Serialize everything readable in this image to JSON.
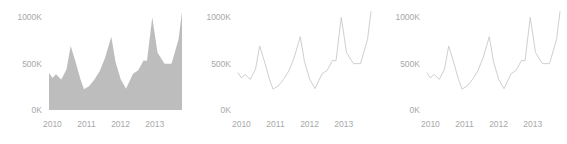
{
  "chart_data": [
    {
      "type": "area",
      "title": "",
      "xlabel": "",
      "ylabel": "",
      "grid": false,
      "legend": "none",
      "fill_color": "#bdbdbd",
      "line_color": "#bdbdbd",
      "ylim": [
        0,
        1100000
      ],
      "xlim": [
        2009.9,
        2013.8
      ],
      "ytick_values": [
        0,
        500000,
        1000000
      ],
      "ytick_labels": [
        "0K",
        "500K",
        "1000K"
      ],
      "xtick_values": [
        2010,
        2011,
        2012,
        2013
      ],
      "xtick_labels": [
        "2010",
        "2011",
        "2012",
        "2013"
      ],
      "x": [
        2010.0,
        2010.1,
        2010.2,
        2010.35,
        2010.5,
        2010.62,
        2010.75,
        2010.9,
        2011.0,
        2011.15,
        2011.3,
        2011.45,
        2011.6,
        2011.78,
        2011.9,
        2012.05,
        2012.2,
        2012.4,
        2012.55,
        2012.7,
        2012.8,
        2012.95,
        2013.1,
        2013.3,
        2013.5,
        2013.7
      ],
      "values": [
        400000,
        345000,
        385000,
        330000,
        440000,
        690000,
        530000,
        330000,
        225000,
        260000,
        330000,
        420000,
        560000,
        790000,
        520000,
        330000,
        230000,
        390000,
        430000,
        535000,
        530000,
        1000000,
        620000,
        500000,
        500000,
        760000,
        1060000
      ]
    },
    {
      "type": "line",
      "title": "",
      "xlabel": "",
      "ylabel": "",
      "grid": false,
      "legend": "none",
      "line_color": "#cfcfcf",
      "ylim": [
        0,
        1100000
      ],
      "xlim": [
        2009.9,
        2013.8
      ],
      "ytick_values": [
        0,
        500000,
        1000000
      ],
      "ytick_labels": [
        "0K",
        "500K",
        "1000K"
      ],
      "xtick_values": [
        2010,
        2011,
        2012,
        2013
      ],
      "xtick_labels": [
        "2010",
        "2011",
        "2012",
        "2013"
      ],
      "x": [
        2010.0,
        2010.1,
        2010.2,
        2010.35,
        2010.5,
        2010.62,
        2010.75,
        2010.9,
        2011.0,
        2011.15,
        2011.3,
        2011.45,
        2011.6,
        2011.78,
        2011.9,
        2012.05,
        2012.2,
        2012.4,
        2012.55,
        2012.7,
        2012.8,
        2012.95,
        2013.1,
        2013.3,
        2013.5,
        2013.7
      ],
      "values": [
        400000,
        345000,
        385000,
        330000,
        440000,
        690000,
        530000,
        330000,
        225000,
        260000,
        330000,
        420000,
        560000,
        790000,
        520000,
        330000,
        230000,
        390000,
        430000,
        535000,
        530000,
        1000000,
        620000,
        500000,
        500000,
        760000,
        1060000
      ]
    },
    {
      "type": "line",
      "title": "",
      "xlabel": "",
      "ylabel": "",
      "grid": false,
      "legend": "none",
      "line_color": "#cfcfcf",
      "ylim": [
        0,
        1100000
      ],
      "xlim": [
        2009.9,
        2013.8
      ],
      "ytick_values": [
        0,
        500000,
        1000000
      ],
      "ytick_labels": [
        "0K",
        "500K",
        "1000K"
      ],
      "xtick_values": [
        2010,
        2011,
        2012,
        2013
      ],
      "xtick_labels": [
        "2010",
        "2011",
        "2012",
        "2013"
      ],
      "x": [
        2010.0,
        2010.1,
        2010.2,
        2010.35,
        2010.5,
        2010.62,
        2010.75,
        2010.9,
        2011.0,
        2011.15,
        2011.3,
        2011.45,
        2011.6,
        2011.78,
        2011.9,
        2012.05,
        2012.2,
        2012.4,
        2012.55,
        2012.7,
        2012.8,
        2012.95,
        2013.1,
        2013.3,
        2013.5,
        2013.7
      ],
      "values": [
        400000,
        345000,
        385000,
        330000,
        440000,
        690000,
        530000,
        330000,
        225000,
        260000,
        330000,
        420000,
        560000,
        790000,
        520000,
        330000,
        230000,
        390000,
        430000,
        535000,
        530000,
        1000000,
        620000,
        500000,
        500000,
        760000,
        1060000
      ]
    }
  ],
  "panels": [
    {
      "name": "area-chart",
      "index": 0
    },
    {
      "name": "line-chart-1",
      "index": 1
    },
    {
      "name": "line-chart-2",
      "index": 2
    }
  ]
}
